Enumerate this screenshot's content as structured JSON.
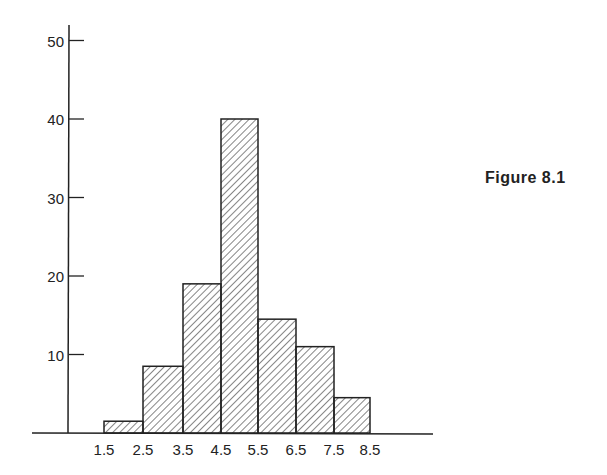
{
  "figure_label": "Figure 8.1",
  "chart_data": {
    "type": "bar",
    "subtype": "histogram",
    "title": "",
    "xlabel": "",
    "ylabel": "",
    "bin_edges": [
      1.5,
      2.5,
      3.5,
      4.5,
      5.5,
      6.5,
      7.5,
      8.5
    ],
    "x_tick_labels": [
      "1.5",
      "2.5",
      "3.5",
      "4.5",
      "5.5",
      "6.5",
      "7.5",
      "8.5"
    ],
    "categories": [
      "1.5-2.5",
      "2.5-3.5",
      "3.5-4.5",
      "4.5-5.5",
      "5.5-6.5",
      "6.5-7.5",
      "7.5-8.5"
    ],
    "values": [
      1.5,
      8.5,
      19,
      40,
      14.5,
      11,
      4.5
    ],
    "y_ticks": [
      10,
      20,
      30,
      40,
      50
    ],
    "y_tick_labels": [
      "10",
      "20",
      "30",
      "40",
      "50"
    ],
    "ylim": [
      0,
      51
    ],
    "grid": false,
    "legend": null,
    "fill": "diagonal hatch",
    "annotations": [
      "Figure 8.1"
    ]
  }
}
